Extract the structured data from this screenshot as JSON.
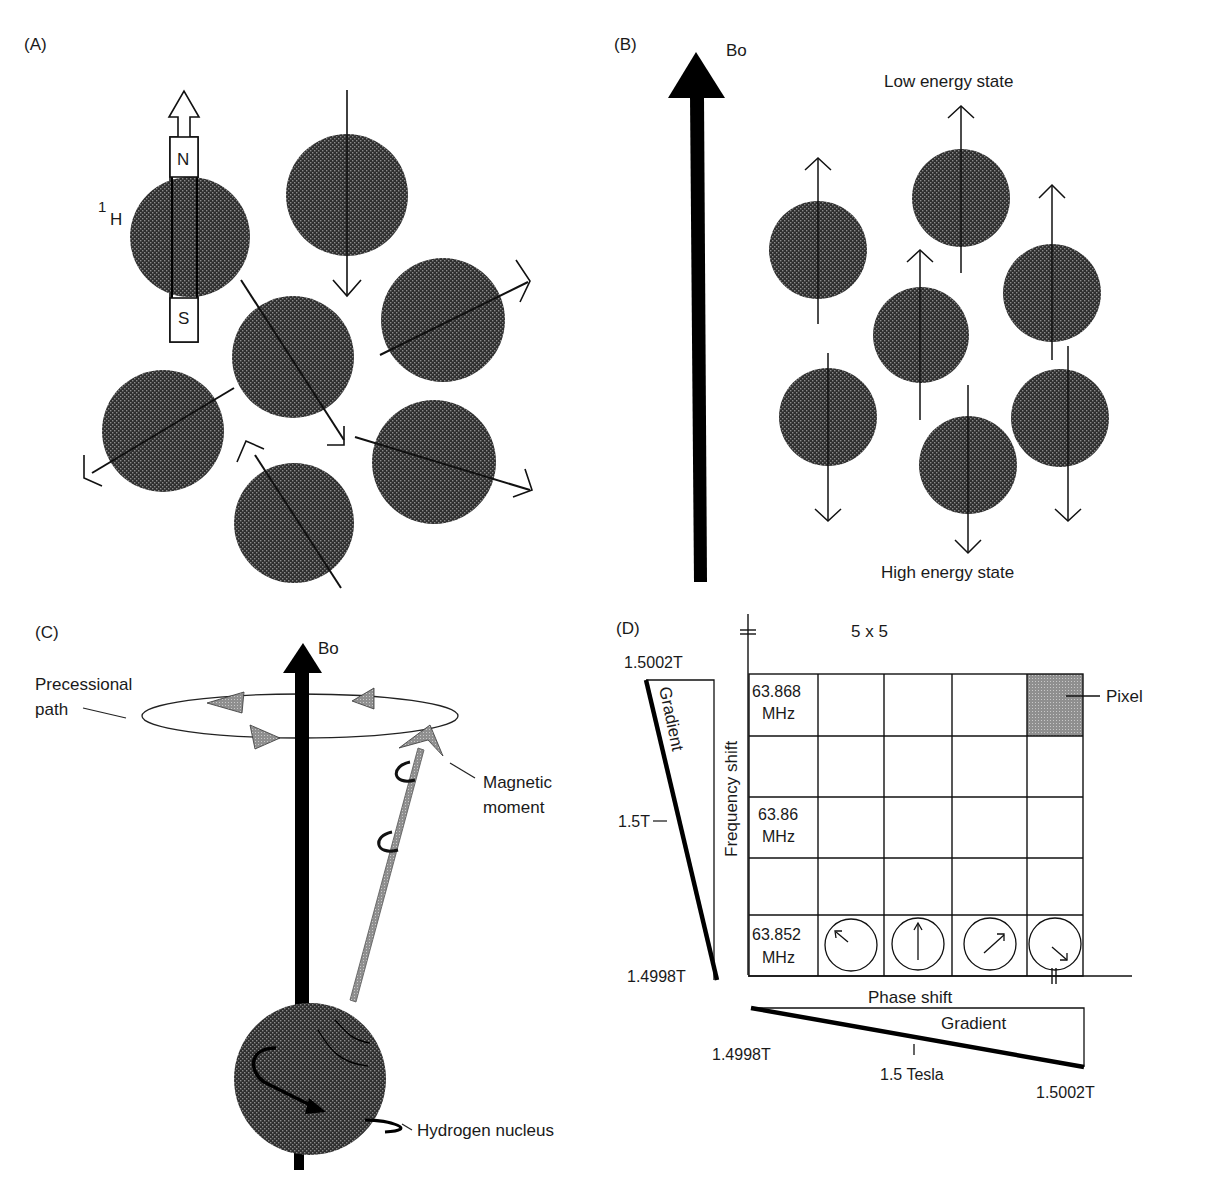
{
  "figure": {
    "panels": [
      {
        "id": "A",
        "label": "(A)",
        "description": "Randomly oriented hydrogen nuclei (protons) acting as tiny bar magnets",
        "bar_magnet": {
          "north_label": "N",
          "south_label": "S"
        },
        "nucleus_label": {
          "superscript": "1",
          "symbol": "H"
        },
        "nuclei_count": 7
      },
      {
        "id": "B",
        "label": "(B)",
        "field_label": "Bo",
        "top_label": "Low energy state",
        "bottom_label": "High energy state",
        "nuclei": [
          {
            "position": "left-upper",
            "orientation": "up"
          },
          {
            "position": "top-center",
            "orientation": "up"
          },
          {
            "position": "center",
            "orientation": "up"
          },
          {
            "position": "right-upper",
            "orientation": "up"
          },
          {
            "position": "left-lower",
            "orientation": "down"
          },
          {
            "position": "bottom-center",
            "orientation": "down"
          },
          {
            "position": "right-lower",
            "orientation": "down"
          }
        ]
      },
      {
        "id": "C",
        "label": "(C)",
        "field_label": "Bo",
        "labels": {
          "precessional_path": [
            "Precessional",
            "path"
          ],
          "magnetic_moment": [
            "Magnetic",
            "moment"
          ],
          "hydrogen_nucleus": "Hydrogen nucleus"
        }
      },
      {
        "id": "D",
        "label": "(D)",
        "grid_title": "5 x 5",
        "grid_rows": 5,
        "grid_cols": 5,
        "vertical_axis_label": "Frequency shift",
        "horizontal_axis_label": "Phase shift",
        "pixel_label": "Pixel",
        "row_labels": [
          {
            "row": 0,
            "line1": "63.868",
            "line2": "MHz"
          },
          {
            "row": 2,
            "line1": "63.86",
            "line2": "MHz"
          },
          {
            "row": 4,
            "line1": "63.852",
            "line2": "MHz"
          }
        ],
        "phase_arrows": [
          {
            "col": 1,
            "direction": "up-left",
            "angle_deg": -45
          },
          {
            "col": 2,
            "direction": "up",
            "angle_deg": 0
          },
          {
            "col": 3,
            "direction": "up-right",
            "angle_deg": 45
          },
          {
            "col": 4,
            "direction": "down-right",
            "angle_deg": 135
          }
        ],
        "vertical_gradient": {
          "label": "Gradient",
          "top": "1.5002T",
          "middle": "1.5T",
          "bottom": "1.4998T"
        },
        "horizontal_gradient": {
          "label": "Gradient",
          "left": "1.4998T",
          "middle": "1.5 Tesla",
          "right": "1.5002T"
        }
      }
    ]
  },
  "colors": {
    "nucleus_fill": "#3a3a3a",
    "pixel_fill": "#9a9a9a",
    "moment_fill": "#8c8c8c",
    "line": "#111111"
  }
}
